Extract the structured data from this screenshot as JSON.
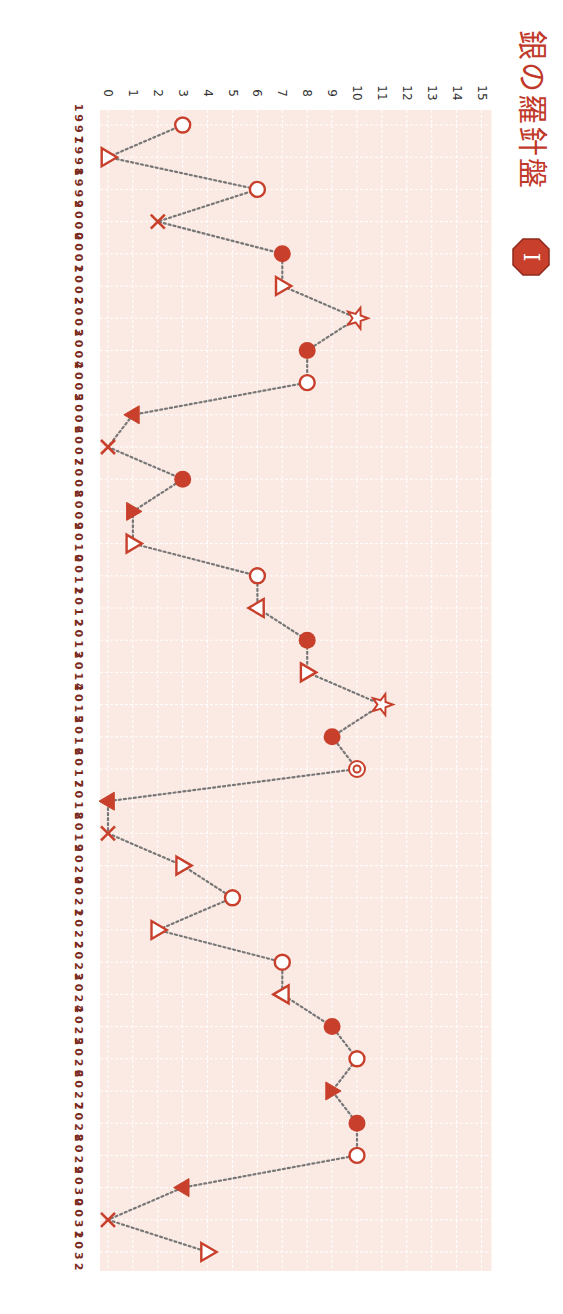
{
  "header": {
    "title": "銀の羅針盤",
    "badge": "I"
  },
  "colors": {
    "accent": "#c8402c",
    "plot_bg": "#fbeae4",
    "grid": "#ffffff",
    "line": "#777777",
    "tick_text": "#333333",
    "year_text": "#7a2a1e"
  },
  "chart_data": {
    "type": "line",
    "orientation": "rotated-90-clockwise",
    "title": "銀の羅針盤",
    "xlabel": "",
    "ylabel": "",
    "ylim": [
      0,
      15
    ],
    "yticks": [
      0,
      1,
      2,
      3,
      4,
      5,
      6,
      7,
      8,
      9,
      10,
      11,
      12,
      13,
      14,
      15
    ],
    "grid": true,
    "line_style": "dotted",
    "categories": [
      "1997",
      "1998",
      "1999",
      "2000",
      "2001",
      "2002",
      "2003",
      "2004",
      "2005",
      "2006",
      "2007",
      "2008",
      "2009",
      "2010",
      "2011",
      "2012",
      "2013",
      "2014",
      "2015",
      "2016",
      "2017",
      "2018",
      "2019",
      "2020",
      "2021",
      "2022",
      "2023",
      "2024",
      "2025",
      "2026",
      "2027",
      "2028",
      "2029",
      "2030",
      "2031",
      "2032"
    ],
    "values": [
      3,
      0,
      6,
      2,
      7,
      7,
      10,
      8,
      8,
      1,
      0,
      3,
      1,
      1,
      6,
      6,
      8,
      8,
      11,
      9,
      10,
      0,
      0,
      3,
      5,
      2,
      7,
      7,
      9,
      10,
      9,
      10,
      10,
      3,
      0,
      4
    ],
    "markers": [
      "circle-open",
      "triangle-up-open",
      "circle-open",
      "cross",
      "circle-filled",
      "triangle-up-open",
      "star-open",
      "circle-filled",
      "circle-open",
      "triangle-down-filled",
      "cross",
      "circle-filled",
      "triangle-up-filled",
      "triangle-up-open",
      "circle-open",
      "triangle-down-open",
      "circle-filled",
      "triangle-up-open",
      "star-open",
      "circle-filled",
      "double-circle",
      "triangle-down-filled",
      "cross",
      "triangle-up-open",
      "circle-open",
      "triangle-up-open",
      "circle-open",
      "triangle-down-open",
      "circle-filled",
      "circle-open",
      "triangle-up-filled",
      "circle-filled",
      "circle-open",
      "triangle-down-filled",
      "cross",
      "triangle-up-open"
    ]
  }
}
